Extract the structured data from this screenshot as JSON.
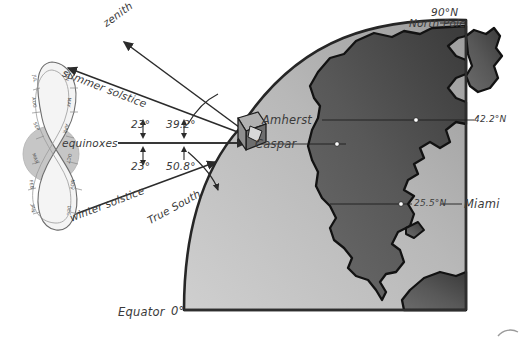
{
  "figure": {
    "type": "astronomy-diagram",
    "title_text": "",
    "background_color": "#ffffff",
    "ink_color": "#2b2b2b"
  },
  "analemma": {
    "name": "analemma-figure-eight",
    "sun_disk_color": "#c9c9c9",
    "band_color": "#f2f2f2",
    "months_left": [
      "JUL",
      "AUG",
      "SEP",
      "MAR",
      "FEB",
      "JAN"
    ],
    "months_right": [
      "JUN",
      "MAY",
      "APR",
      "OCT",
      "NOV",
      "DEC"
    ],
    "months_all": [
      "JAN",
      "FEB",
      "MAR",
      "APR",
      "MAY",
      "JUN",
      "JUL",
      "AUG",
      "SEP",
      "OCT",
      "NOV",
      "DEC"
    ]
  },
  "rays": {
    "zenith_label": "zenith",
    "summer_solstice_label": "summer solstice",
    "equinoxes_label": "equinoxes",
    "winter_solstice_label": "winter solstice",
    "true_south_label": "True South"
  },
  "angles": {
    "summer_tilt": "23°",
    "summer_altitude": "39.2°",
    "winter_tilt": "23°",
    "winter_altitude": "50.8°"
  },
  "globe": {
    "north_pole_degrees": "90°N",
    "north_pole_name": "North Pole",
    "equator_label": "Equator",
    "equator_degrees": "0°",
    "ocean_color": "#b4b4b4",
    "land_color": "#595959",
    "outline_color": "#1a1a1a"
  },
  "places": [
    {
      "name": "Amherst",
      "latitude": "42.2°N"
    },
    {
      "name": "Caspar",
      "latitude": ""
    },
    {
      "name": "Miami",
      "latitude": "25.5°N"
    }
  ],
  "gnomon": {
    "name": "sundial-gnomon-block",
    "face_color": "#8c8c8c",
    "shadow_color": "#4a4a4a"
  }
}
